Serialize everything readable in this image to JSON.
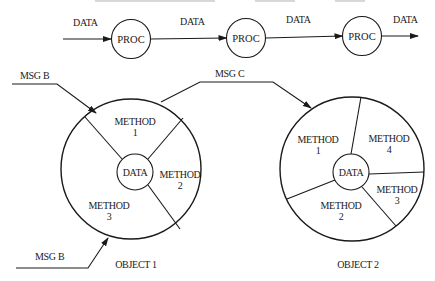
{
  "diagram": {
    "title_cutoff": "",
    "pipeline": {
      "flow_label": "DATA",
      "in_label": "DATA",
      "between_1_2_label": "DATA",
      "between_2_3_label": "DATA",
      "out_label": "DATA",
      "processes": [
        {
          "label": "PROC"
        },
        {
          "label": "PROC"
        },
        {
          "label": "PROC"
        }
      ]
    },
    "messages": {
      "msg_b_top": "MSG B",
      "msg_c": "MSG C",
      "msg_b_bottom": "MSG B"
    },
    "objects": [
      {
        "name": "OBJECT 1",
        "core": "DATA",
        "methods": [
          {
            "line1": "METHOD",
            "line2": "1"
          },
          {
            "line1": "METHOD",
            "line2": "2"
          },
          {
            "line1": "METHOD",
            "line2": "3"
          }
        ]
      },
      {
        "name": "OBJECT 2",
        "core": "DATA",
        "methods": [
          {
            "line1": "METHOD",
            "line2": "1"
          },
          {
            "line1": "METHOD",
            "line2": "2"
          },
          {
            "line1": "METHOD",
            "line2": "3"
          },
          {
            "line1": "METHOD",
            "line2": "4"
          }
        ]
      }
    ],
    "colors": {
      "ink": "#1a1a1a",
      "background": "#ffffff"
    }
  }
}
